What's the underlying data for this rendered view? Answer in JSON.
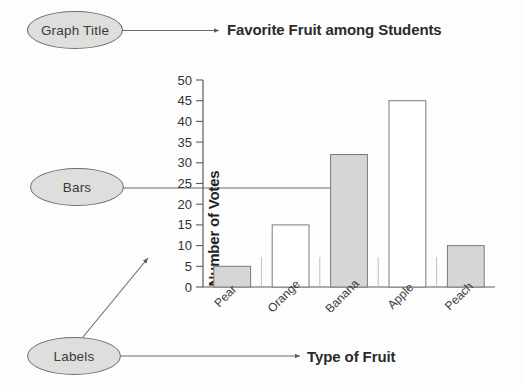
{
  "annotations": {
    "graph_title_callout": "Graph Title",
    "bars_callout": "Bars",
    "labels_callout": "Labels"
  },
  "chart_data": {
    "type": "bar",
    "title": "Favorite Fruit among Students",
    "xlabel": "Type of Fruit",
    "ylabel": "Number of Votes",
    "categories": [
      "Pear",
      "Orange",
      "Banana",
      "Apple",
      "Peach"
    ],
    "values": [
      5,
      15,
      32,
      45,
      10
    ],
    "bar_fills": [
      "gray",
      "white",
      "gray",
      "white",
      "gray"
    ],
    "ylim": [
      0,
      50
    ],
    "yticks": [
      0,
      5,
      10,
      15,
      20,
      25,
      30,
      35,
      40,
      45,
      50
    ],
    "ytick_labels": [
      "0",
      "5",
      "10",
      "15",
      "20",
      "25",
      "30",
      "35",
      "40",
      "45",
      "50"
    ],
    "grid": false,
    "legend": "none",
    "xtick_rotation_deg": 45,
    "colors": {
      "bar_gray_fill": "#d6d6d6",
      "bar_white_fill": "#ffffff",
      "bar_stroke": "#7a7a7a",
      "axis": "#5a5a5a",
      "callout_fill": "#dededd",
      "callout_stroke": "#6f6f6f",
      "text": "#2b2b2b",
      "connector": "#6b6b6b"
    }
  }
}
